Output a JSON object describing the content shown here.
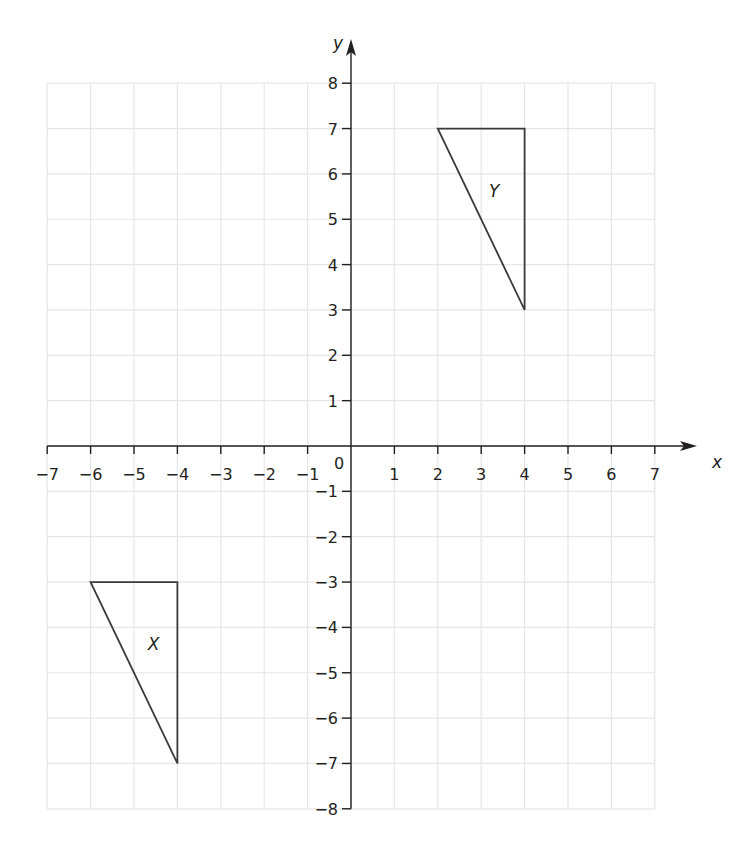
{
  "chart_data": {
    "type": "scatter",
    "title": "",
    "xlabel": "x",
    "ylabel": "y",
    "xlim": [
      -7,
      7
    ],
    "ylim": [
      -8,
      8
    ],
    "grid": true,
    "x_ticks": [
      -7,
      -6,
      -5,
      -4,
      -3,
      -2,
      -1,
      1,
      2,
      3,
      4,
      5,
      6,
      7
    ],
    "y_ticks": [
      8,
      7,
      6,
      5,
      4,
      3,
      2,
      1,
      -1,
      -2,
      -3,
      -4,
      -5,
      -6,
      -7,
      -8
    ],
    "origin_label": "0",
    "shapes": [
      {
        "name": "Y",
        "label": "Y",
        "vertices": [
          [
            2,
            7
          ],
          [
            4,
            7
          ],
          [
            4,
            3
          ]
        ],
        "label_position": [
          3.3,
          5.5
        ]
      },
      {
        "name": "X",
        "label": "X",
        "vertices": [
          [
            -6,
            -3
          ],
          [
            -4,
            -3
          ],
          [
            -4,
            -7
          ]
        ],
        "label_position": [
          -4.55,
          -4.5
        ]
      }
    ]
  },
  "axes": {
    "x_label": "x",
    "y_label": "y",
    "origin_label": "0"
  },
  "colors": {
    "axis": "#231f20",
    "grid": "#e6e6e6",
    "shape_stroke": "#3a3a3a",
    "text": "#231f20"
  }
}
